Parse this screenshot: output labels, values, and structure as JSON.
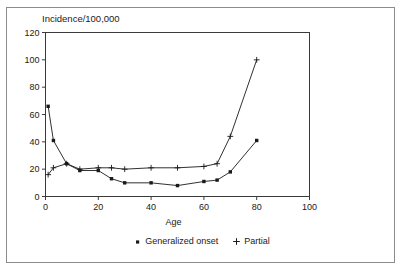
{
  "chart_data": {
    "type": "line",
    "title": "Incidence/100,000",
    "xlabel": "Age",
    "ylabel": "Incidence/100,000",
    "xlim": [
      0,
      100
    ],
    "ylim": [
      0,
      120
    ],
    "xticks": [
      "0",
      "20",
      "40",
      "60",
      "80",
      "100"
    ],
    "yticks": [
      "0",
      "20",
      "40",
      "60",
      "80",
      "100",
      "120"
    ],
    "xtick_values": [
      0,
      20,
      40,
      60,
      80,
      100
    ],
    "ytick_values": [
      0,
      20,
      40,
      60,
      80,
      100,
      120
    ],
    "grid": false,
    "legend_position": "bottom",
    "series": [
      {
        "name": "Generalized onset",
        "marker": "filled-square",
        "x": [
          1,
          3,
          8,
          13,
          20,
          25,
          30,
          40,
          50,
          60,
          65,
          70,
          80
        ],
        "values": [
          66,
          41,
          24,
          19,
          19,
          13,
          10,
          10,
          8,
          11,
          12,
          18,
          41
        ]
      },
      {
        "name": "Partial",
        "marker": "plus",
        "x": [
          1,
          3,
          8,
          13,
          20,
          25,
          30,
          40,
          50,
          60,
          65,
          70,
          80
        ],
        "values": [
          16,
          21,
          24,
          20,
          21,
          21,
          20,
          21,
          21,
          22,
          24,
          44,
          100
        ]
      }
    ]
  },
  "legend": {
    "entries": [
      {
        "label": "Generalized onset",
        "marker": "filled-square"
      },
      {
        "label": "Partial",
        "marker": "plus"
      }
    ]
  },
  "axes": {
    "x_label": "Age",
    "y_label": "Incidence/100,000"
  },
  "colors": {
    "line": "#1a1a1a",
    "frame": "#3a3a3a",
    "outer_frame": "#8c8c8c",
    "background": "#ffffff",
    "text": "#1a1a1a"
  }
}
